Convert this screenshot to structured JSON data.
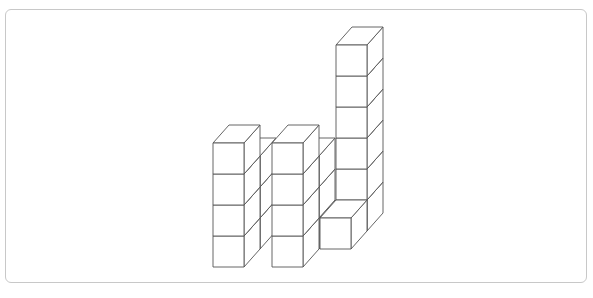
{
  "figure": {
    "cube_size": 31,
    "depth_offset": {
      "dx": 16,
      "dy": -18
    },
    "stroke_color": "#555555",
    "fill_color": "#ffffff",
    "frame_color": "#c8c8c8",
    "cubes": [
      {
        "x": 229,
        "y": 249,
        "h": 3
      },
      {
        "x": 288,
        "y": 249,
        "h": 3
      },
      {
        "x": 336,
        "y": 231,
        "h": 6
      },
      {
        "x": 320,
        "y": 249,
        "h": 1
      },
      {
        "x": 213,
        "y": 267,
        "h": 4
      },
      {
        "x": 272,
        "y": 267,
        "h": 4
      }
    ]
  }
}
